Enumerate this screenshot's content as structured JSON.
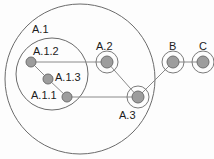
{
  "diagram": {
    "colors": {
      "background": "#fdfdfd",
      "group_stroke": "#6b6b6b",
      "halo_stroke": "#7a7a7a",
      "edge_stroke": "#8a8a8a",
      "node_fill": "#9d9d9d",
      "node_stroke": "#6f6f6f",
      "label_color": "#1c1c1c"
    },
    "groups": [
      {
        "id": "A",
        "label": "",
        "cx": 80,
        "cy": 79,
        "r": 75
      },
      {
        "id": "A.1",
        "label": "A.1",
        "cx": 52,
        "cy": 74,
        "r": 36
      }
    ],
    "halos": [
      {
        "id": "halo-A.2",
        "cx": 107,
        "cy": 62,
        "r": 11
      },
      {
        "id": "halo-A.3",
        "cx": 138,
        "cy": 97,
        "r": 11
      },
      {
        "id": "halo-B",
        "cx": 173,
        "cy": 62,
        "r": 11
      },
      {
        "id": "halo-C",
        "cx": 203,
        "cy": 62,
        "r": 11
      }
    ],
    "nodes": [
      {
        "id": "A.1.2",
        "label": "A.1.2",
        "cx": 31,
        "cy": 62,
        "r": 5
      },
      {
        "id": "A.1.3",
        "label": "A.1.3",
        "cx": 48,
        "cy": 79,
        "r": 5
      },
      {
        "id": "A.1.1",
        "label": "A.1.1",
        "cx": 67,
        "cy": 97,
        "r": 5
      },
      {
        "id": "A.2",
        "label": "A.2",
        "cx": 107,
        "cy": 62,
        "r": 6
      },
      {
        "id": "A.3",
        "label": "A.3",
        "cx": 138,
        "cy": 97,
        "r": 6
      },
      {
        "id": "B",
        "label": "B",
        "cx": 173,
        "cy": 62,
        "r": 6
      },
      {
        "id": "C",
        "label": "C",
        "cx": 203,
        "cy": 62,
        "r": 6
      }
    ],
    "edges": [
      {
        "from": "A.1.2",
        "to": "A.1.3",
        "x1": 31,
        "y1": 62,
        "x2": 48,
        "y2": 79
      },
      {
        "from": "A.1.3",
        "to": "A.1.1",
        "x1": 48,
        "y1": 79,
        "x2": 67,
        "y2": 97
      },
      {
        "from": "A.1.2",
        "to": "A.2",
        "x1": 31,
        "y1": 62,
        "x2": 107,
        "y2": 62
      },
      {
        "from": "A.1.1",
        "to": "A.3",
        "x1": 67,
        "y1": 97,
        "x2": 138,
        "y2": 97
      },
      {
        "from": "A.2",
        "to": "A.3",
        "x1": 107,
        "y1": 62,
        "x2": 138,
        "y2": 97
      },
      {
        "from": "A.3",
        "to": "B",
        "x1": 138,
        "y1": 97,
        "x2": 173,
        "y2": 62
      },
      {
        "from": "B",
        "to": "C",
        "x1": 173,
        "y1": 62,
        "x2": 203,
        "y2": 62
      }
    ],
    "labels": [
      {
        "id": "label-A.1",
        "text": "A.1",
        "x": 32,
        "y": 24
      },
      {
        "id": "label-A.1.2",
        "text": "A.1.2",
        "x": 33,
        "y": 46
      },
      {
        "id": "label-A.1.3",
        "text": "A.1.3",
        "x": 55,
        "y": 72
      },
      {
        "id": "label-A.1.1",
        "text": "A.1.1",
        "x": 31,
        "y": 90
      },
      {
        "id": "label-A.2",
        "text": "A.2",
        "x": 96,
        "y": 41
      },
      {
        "id": "label-A.3",
        "text": "A.3",
        "x": 119,
        "y": 110
      },
      {
        "id": "label-B",
        "text": "B",
        "x": 169,
        "y": 41
      },
      {
        "id": "label-C",
        "text": "C",
        "x": 199,
        "y": 41
      }
    ]
  }
}
